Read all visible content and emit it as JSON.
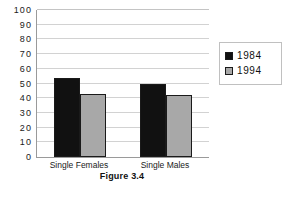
{
  "caption": "Figure 3.4",
  "legend": {
    "position": "right",
    "entries": [
      {
        "label": "1984",
        "color": "#111111",
        "swatch_name": "legend-swatch-1984"
      },
      {
        "label": "1994",
        "color": "#a8a8a8",
        "swatch_name": "legend-swatch-1994"
      }
    ]
  },
  "axes": {
    "y_ticks": [
      "100",
      "90",
      "80",
      "70",
      "60",
      "50",
      "40",
      "30",
      "20",
      "10",
      "0"
    ],
    "x_ticks": [
      "Single Females",
      "Single Males"
    ]
  },
  "chart_data": {
    "type": "bar",
    "title": "Figure 3.4",
    "xlabel": "",
    "ylabel": "",
    "categories": [
      "Single Females",
      "Single Males"
    ],
    "series": [
      {
        "name": "1984",
        "color": "#111111",
        "values": [
          54,
          50
        ]
      },
      {
        "name": "1994",
        "color": "#a8a8a8",
        "values": [
          43,
          42
        ]
      }
    ],
    "ylim": [
      0,
      100
    ],
    "ytick_step": 10,
    "grid": "horizontal",
    "legend_position": "right"
  }
}
